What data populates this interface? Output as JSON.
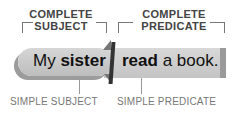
{
  "complete_subject": {
    "line1": "COMPLETE",
    "line2": "SUBJECT"
  },
  "complete_predicate": {
    "line1": "COMPLETE",
    "line2": "PREDICATE"
  },
  "sentence": {
    "subject_plain": "My ",
    "subject_bold": "sister",
    "predicate_bold": "read",
    "predicate_plain": " a book."
  },
  "simple_subject_label": "SIMPLE SUBJECT",
  "simple_predicate_label": "SIMPLE PREDICATE"
}
